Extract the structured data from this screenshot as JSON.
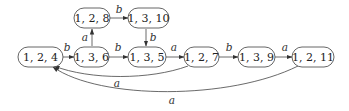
{
  "diagram": {
    "type": "state-transition-graph",
    "nodes": [
      {
        "id": "n124",
        "label": "1, 2, 4"
      },
      {
        "id": "n136",
        "label": "1, 3, 6"
      },
      {
        "id": "n128",
        "label": "1, 2, 8"
      },
      {
        "id": "n1310",
        "label": "1, 3, 10"
      },
      {
        "id": "n135",
        "label": "1, 3, 5"
      },
      {
        "id": "n127",
        "label": "1, 2, 7"
      },
      {
        "id": "n139",
        "label": "1, 3, 9"
      },
      {
        "id": "n1211",
        "label": "1, 2, 11"
      }
    ],
    "edges": [
      {
        "from": "1, 2, 4",
        "to": "1, 3, 6",
        "label": "b"
      },
      {
        "from": "1, 3, 6",
        "to": "1, 2, 8",
        "label": "a"
      },
      {
        "from": "1, 2, 8",
        "to": "1, 3, 10",
        "label": "b"
      },
      {
        "from": "1, 3, 10",
        "to": "1, 3, 5",
        "label": "b"
      },
      {
        "from": "1, 3, 6",
        "to": "1, 3, 5",
        "label": "b"
      },
      {
        "from": "1, 3, 5",
        "to": "1, 2, 7",
        "label": "a"
      },
      {
        "from": "1, 2, 7",
        "to": "1, 3, 9",
        "label": "b"
      },
      {
        "from": "1, 3, 9",
        "to": "1, 2, 11",
        "label": "a"
      },
      {
        "from": "1, 2, 7",
        "to": "1, 2, 4",
        "label": "a"
      },
      {
        "from": "1, 2, 11",
        "to": "1, 2, 4",
        "label": "a"
      }
    ]
  }
}
